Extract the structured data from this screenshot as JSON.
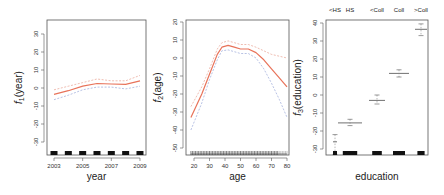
{
  "chart_data": [
    {
      "type": "line",
      "title": "",
      "xlabel": "year",
      "ylabel": "f1(year)",
      "ylabel_main": "f",
      "ylabel_sub": "1",
      "ylabel_rest": "(year)",
      "xlim": [
        2003,
        2009
      ],
      "ylim": [
        -30,
        30
      ],
      "xticks": [
        2003,
        2005,
        2007,
        2009
      ],
      "yticks": [
        -30,
        -20,
        -10,
        0,
        10,
        20,
        30
      ],
      "grid": false,
      "x": [
        2003,
        2004,
        2005,
        2006,
        2007,
        2008,
        2009
      ],
      "series": [
        {
          "name": "estimate",
          "color": "#e8735a",
          "style": "solid",
          "values": [
            -3.5,
            -1.5,
            1,
            2.5,
            2.2,
            2,
            4
          ]
        },
        {
          "name": "upper SE",
          "color": "#e8a090",
          "style": "dashed",
          "values": [
            -1,
            1,
            3,
            5,
            4,
            4,
            7
          ]
        },
        {
          "name": "lower SE",
          "color": "#9aa8d8",
          "style": "dashed",
          "values": [
            -6.5,
            -4,
            -1,
            0.5,
            0.5,
            -0.5,
            1
          ]
        }
      ],
      "rug": [
        2003,
        2004,
        2005,
        2006,
        2007,
        2008,
        2009
      ]
    },
    {
      "type": "line",
      "title": "",
      "xlabel": "age",
      "ylabel": "f2(age)",
      "ylabel_main": "f",
      "ylabel_sub": "2",
      "ylabel_rest": "(age)",
      "xlim": [
        18,
        80
      ],
      "ylim": [
        -50,
        20
      ],
      "xticks": [
        20,
        30,
        40,
        50,
        60,
        70,
        80
      ],
      "yticks": [
        -50,
        -40,
        -30,
        -20,
        -10,
        0,
        10,
        20
      ],
      "grid": false,
      "x": [
        18,
        25,
        30,
        35,
        38,
        42,
        46,
        50,
        55,
        60,
        65,
        70,
        75,
        80
      ],
      "series": [
        {
          "name": "estimate",
          "color": "#e8735a",
          "style": "solid",
          "values": [
            -33,
            -20,
            -9,
            2,
            6,
            7,
            6,
            5,
            5,
            3,
            -1,
            -6,
            -11,
            -16
          ]
        },
        {
          "name": "upper SE",
          "color": "#e8a090",
          "style": "dashed",
          "values": [
            -27,
            -16,
            -6,
            5,
            8.5,
            9.5,
            8.5,
            7.5,
            7.5,
            6,
            4,
            2,
            1,
            0
          ]
        },
        {
          "name": "lower SE",
          "color": "#9aa8d8",
          "style": "dashed",
          "values": [
            -40,
            -25,
            -12,
            -1,
            4,
            4.5,
            3.5,
            2.5,
            2.5,
            0,
            -6,
            -14,
            -23,
            -33
          ]
        }
      ],
      "rug_range": [
        18,
        80
      ]
    },
    {
      "type": "scatter",
      "title": "",
      "xlabel": "education",
      "ylabel": "f3(education)",
      "ylabel_main": "f",
      "ylabel_sub": "3",
      "ylabel_rest": "(education)",
      "ylim": [
        -30,
        40
      ],
      "yticks": [
        -30,
        -20,
        -10,
        0,
        10,
        20,
        30,
        40
      ],
      "grid": false,
      "categories": [
        "<HS",
        "HS",
        "<Coll",
        "Coll",
        ">Coll"
      ],
      "values": [
        -26,
        -15.5,
        -3,
        12,
        36.5
      ],
      "upper": [
        -22,
        -13.5,
        0,
        14,
        39.5
      ],
      "lower": [
        -33,
        -17,
        -5,
        10,
        33
      ]
    }
  ]
}
